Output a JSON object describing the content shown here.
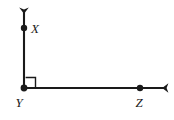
{
  "figure": {
    "kind": "geometry-diagram",
    "background_color": "#ffffff",
    "stroke_color": "#1a1a1a",
    "label_color": "#1a1a1a",
    "width": 174,
    "height": 120,
    "vertex": {
      "name": "Y",
      "label": "Y",
      "x": 24,
      "y": 88,
      "label_x": 19,
      "label_y": 106
    },
    "rays": [
      {
        "name": "ray-YX",
        "direction": "up",
        "from_x": 24,
        "from_y": 88,
        "to_x": 24,
        "to_y": 10,
        "arrowhead": true
      },
      {
        "name": "ray-YZ",
        "direction": "right",
        "from_x": 24,
        "from_y": 88,
        "to_x": 166,
        "to_y": 88,
        "arrowhead": true
      }
    ],
    "points": [
      {
        "name": "X",
        "label": "X",
        "x": 24,
        "y": 28,
        "radius": 3.2,
        "label_x": 31,
        "label_y": 33
      },
      {
        "name": "Y",
        "label": "Y",
        "x": 24,
        "y": 88,
        "radius": 3.4,
        "label_x": 19,
        "label_y": 106
      },
      {
        "name": "Z",
        "label": "Z",
        "x": 140,
        "y": 88,
        "radius": 3.2,
        "label_x": 135,
        "label_y": 106
      }
    ],
    "right_angle_marker": {
      "name": "right-angle-square",
      "at_vertex": "Y",
      "size": 10,
      "x": 24,
      "y": 88,
      "angle_degrees": 90
    },
    "angle_measure_label": ""
  }
}
